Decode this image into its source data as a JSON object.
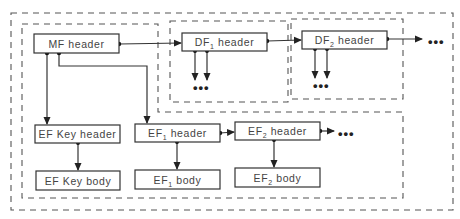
{
  "diagram": {
    "type": "file-structure-hierarchy",
    "regions": {
      "outer": {
        "label": ""
      },
      "mf": {
        "label": ""
      },
      "df1": {
        "label": ""
      },
      "df2": {
        "label": ""
      }
    },
    "nodes": {
      "mf_header": {
        "text": "MF header"
      },
      "df1_header": {
        "prefix": "DF",
        "sub": "1",
        "suffix": " header"
      },
      "df2_header": {
        "prefix": "DF",
        "sub": "2",
        "suffix": " header"
      },
      "ef_key_header": {
        "text": "EF Key header"
      },
      "ef_key_body": {
        "text": "EF Key body"
      },
      "ef1_header": {
        "prefix": "EF",
        "sub": "1",
        "suffix": " header"
      },
      "ef1_body": {
        "prefix": "EF",
        "sub": "1",
        "suffix": " body"
      },
      "ef2_header": {
        "prefix": "EF",
        "sub": "2",
        "suffix": " header"
      },
      "ef2_body": {
        "prefix": "EF",
        "sub": "2",
        "suffix": " body"
      }
    },
    "ellipsis": "•••",
    "edges": [
      {
        "from": "MF header",
        "to": "DF1 header"
      },
      {
        "from": "DF1 header",
        "to": "DF2 header"
      },
      {
        "from": "DF2 header",
        "to": "..."
      },
      {
        "from": "DF1 header",
        "to": "... (children)"
      },
      {
        "from": "DF2 header",
        "to": "... (children)"
      },
      {
        "from": "MF header",
        "to": "EF Key header"
      },
      {
        "from": "MF header",
        "to": "EF1 header"
      },
      {
        "from": "EF Key header",
        "to": "EF Key body"
      },
      {
        "from": "EF1 header",
        "to": "EF1 body"
      },
      {
        "from": "EF1 header",
        "to": "EF2 header"
      },
      {
        "from": "EF2 header",
        "to": "EF2 body"
      },
      {
        "from": "EF2 header",
        "to": "..."
      }
    ]
  }
}
